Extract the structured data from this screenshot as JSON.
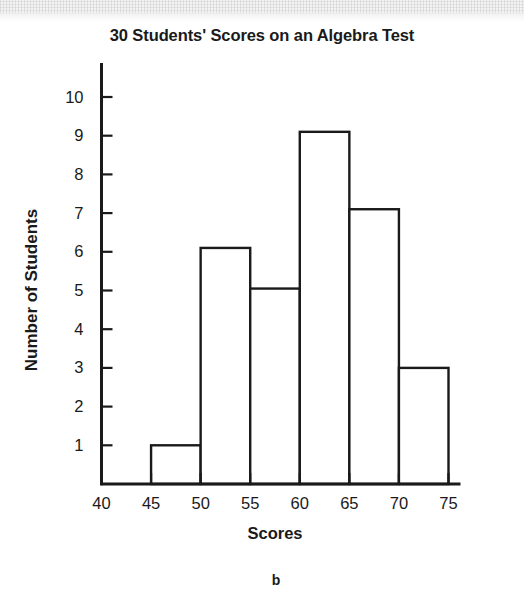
{
  "figure": {
    "label": "b",
    "scan_band": "scan-artifact"
  },
  "chart_data": {
    "type": "bar",
    "title": "30 Students' Scores on an Algebra Test",
    "xlabel": "Scores",
    "ylabel": "Number of Students",
    "bin_edges": [
      40,
      45,
      50,
      55,
      60,
      65,
      70,
      75
    ],
    "categories": [
      "40-45",
      "45-50",
      "50-55",
      "55-60",
      "60-65",
      "65-70",
      "70-75"
    ],
    "values": [
      0,
      1,
      6,
      5,
      9,
      7,
      3
    ],
    "total_students": 30,
    "xlim": [
      40,
      75
    ],
    "ylim": [
      0,
      10
    ],
    "xticks": [
      40,
      45,
      50,
      55,
      60,
      65,
      70,
      75
    ],
    "xtick_labels": [
      "40",
      "45",
      "50",
      "55",
      "60",
      "65",
      "70",
      "75"
    ],
    "yticks": [
      1,
      2,
      3,
      4,
      5,
      6,
      7,
      8,
      9,
      10
    ],
    "ytick_labels": [
      "1",
      "2",
      "3",
      "4",
      "5",
      "6",
      "7",
      "8",
      "9",
      "10"
    ],
    "grid": false,
    "legend": false,
    "bar_fill": "#ffffff",
    "bar_stroke": "#1a1a1a",
    "axis_color": "#1a1a1a"
  }
}
